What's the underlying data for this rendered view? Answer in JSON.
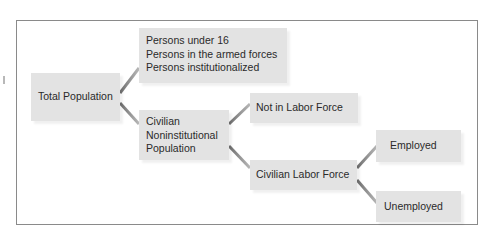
{
  "diagram": {
    "nodes": {
      "total_population": {
        "label": "Total Population"
      },
      "excluded": {
        "lines": [
          "Persons under 16",
          "Persons in the armed forces",
          "Persons institutionalized"
        ]
      },
      "civilian_noninstitutional": {
        "lines": [
          "Civilian",
          "Noninstitutional",
          "Population"
        ]
      },
      "not_in_labor_force": {
        "label": "Not in Labor Force"
      },
      "civilian_labor_force": {
        "label": "Civilian Labor Force"
      },
      "employed": {
        "label": "Employed"
      },
      "unemployed": {
        "label": "Unemployed"
      }
    },
    "edges": [
      {
        "from": "Total Population",
        "to": "Persons under 16 / armed forces / institutionalized"
      },
      {
        "from": "Total Population",
        "to": "Civilian Noninstitutional Population"
      },
      {
        "from": "Civilian Noninstitutional Population",
        "to": "Not in Labor Force"
      },
      {
        "from": "Civilian Noninstitutional Population",
        "to": "Civilian Labor Force"
      },
      {
        "from": "Civilian Labor Force",
        "to": "Employed"
      },
      {
        "from": "Civilian Labor Force",
        "to": "Unemployed"
      }
    ],
    "colors": {
      "box_fill": "#e3e3e3",
      "connector": "#8c8c8c",
      "frame": "#8a8a8a",
      "text": "#2a2a2a"
    }
  }
}
